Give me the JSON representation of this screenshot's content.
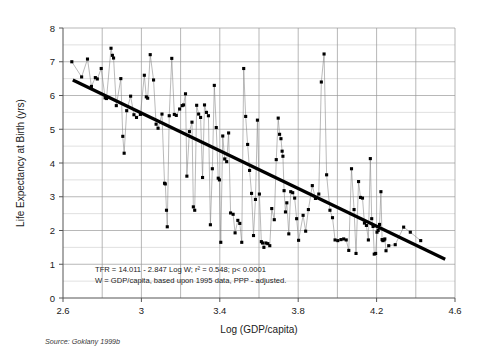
{
  "figure": {
    "background_color": "#ffffff",
    "source_note": "Source: Goklany 1999b"
  },
  "chart_data": {
    "type": "scatter",
    "title": "",
    "subtitle": "",
    "xlabel": "Log (GDP/capita)",
    "ylabel": "Life Expectancy at Birth (yrs)",
    "xlim": [
      2.6,
      4.6
    ],
    "ylim": [
      0,
      8
    ],
    "xticks": [
      2.6,
      3,
      3.4,
      3.8,
      4.2,
      4.6
    ],
    "xtick_labels": [
      "2.6",
      "3",
      "3.4",
      "3.8",
      "4.2",
      "4.6"
    ],
    "yticks": [
      0,
      1,
      2,
      3,
      4,
      5,
      6,
      7,
      8
    ],
    "ytick_labels": [
      "0",
      "1",
      "2",
      "3",
      "4",
      "5",
      "6",
      "7",
      "8"
    ],
    "grid": "both",
    "grid_x_step": 0.2,
    "grid_y_major_step": 1,
    "grid_y_minor_step": 0.5,
    "legend": "none",
    "marker": "square",
    "marker_color": "#000000",
    "connector_color": "#808080",
    "connected": true,
    "annotations": [
      "TFR = 14.011 - 2.847 Log W; r² = 0.548; p< 0.0001",
      "W = GDP/capita, based upon 1995 data, PPP - adjusted."
    ],
    "trendline": {
      "label": "TFR = 14.011 - 2.847 Log W",
      "intercept": 14.011,
      "slope": -2.847,
      "r_squared": 0.548,
      "p_value": "< 0.0001",
      "color": "#000000",
      "width": 3.2,
      "x_start": 2.65,
      "y_start": 6.46,
      "x_end": 4.55,
      "y_end": 1.15
    },
    "points": [
      [
        2.645,
        7.0
      ],
      [
        2.695,
        6.55
      ],
      [
        2.725,
        7.08
      ],
      [
        2.745,
        6.27
      ],
      [
        2.765,
        6.53
      ],
      [
        2.775,
        6.49
      ],
      [
        2.795,
        6.8
      ],
      [
        2.815,
        5.93
      ],
      [
        2.822,
        5.91
      ],
      [
        2.845,
        7.4
      ],
      [
        2.852,
        7.19
      ],
      [
        2.858,
        7.11
      ],
      [
        2.872,
        5.7
      ],
      [
        2.895,
        6.5
      ],
      [
        2.905,
        4.79
      ],
      [
        2.912,
        4.29
      ],
      [
        2.925,
        5.55
      ],
      [
        2.945,
        5.98
      ],
      [
        2.962,
        5.43
      ],
      [
        2.975,
        5.35
      ],
      [
        2.995,
        5.44
      ],
      [
        3.015,
        6.6
      ],
      [
        3.025,
        5.96
      ],
      [
        3.032,
        5.92
      ],
      [
        3.045,
        7.21
      ],
      [
        3.062,
        6.46
      ],
      [
        3.075,
        5.15
      ],
      [
        3.085,
        5.03
      ],
      [
        3.105,
        5.45
      ],
      [
        3.118,
        3.4
      ],
      [
        3.122,
        3.38
      ],
      [
        3.128,
        2.6
      ],
      [
        3.132,
        2.11
      ],
      [
        3.142,
        5.4
      ],
      [
        3.155,
        7.1
      ],
      [
        3.168,
        5.44
      ],
      [
        3.178,
        5.41
      ],
      [
        3.195,
        5.6
      ],
      [
        3.208,
        5.7
      ],
      [
        3.215,
        5.72
      ],
      [
        3.225,
        6.05
      ],
      [
        3.232,
        3.61
      ],
      [
        3.245,
        4.93
      ],
      [
        3.258,
        5.21
      ],
      [
        3.265,
        2.7
      ],
      [
        3.272,
        2.6
      ],
      [
        3.282,
        5.71
      ],
      [
        3.292,
        5.45
      ],
      [
        3.302,
        5.35
      ],
      [
        3.312,
        3.57
      ],
      [
        3.322,
        5.72
      ],
      [
        3.332,
        5.5
      ],
      [
        3.342,
        5.4
      ],
      [
        3.352,
        2.17
      ],
      [
        3.362,
        3.83
      ],
      [
        3.372,
        6.3
      ],
      [
        3.382,
        5.05
      ],
      [
        3.392,
        3.55
      ],
      [
        3.398,
        3.5
      ],
      [
        3.405,
        1.65
      ],
      [
        3.415,
        4.8
      ],
      [
        3.425,
        4.12
      ],
      [
        3.435,
        4.04
      ],
      [
        3.445,
        4.89
      ],
      [
        3.455,
        2.52
      ],
      [
        3.468,
        2.48
      ],
      [
        3.478,
        1.93
      ],
      [
        3.492,
        2.3
      ],
      [
        3.502,
        2.21
      ],
      [
        3.512,
        1.65
      ],
      [
        3.522,
        6.8
      ],
      [
        3.532,
        5.38
      ],
      [
        3.542,
        4.55
      ],
      [
        3.552,
        3.78
      ],
      [
        3.562,
        3.1
      ],
      [
        3.572,
        1.85
      ],
      [
        3.582,
        2.92
      ],
      [
        3.592,
        5.27
      ],
      [
        3.602,
        3.08
      ],
      [
        3.612,
        1.67
      ],
      [
        3.618,
        1.63
      ],
      [
        3.625,
        1.5
      ],
      [
        3.635,
        1.63
      ],
      [
        3.645,
        1.61
      ],
      [
        3.655,
        1.55
      ],
      [
        3.665,
        2.65
      ],
      [
        3.678,
        2.32
      ],
      [
        3.688,
        4.1
      ],
      [
        3.698,
        5.33
      ],
      [
        3.705,
        4.85
      ],
      [
        3.712,
        4.72
      ],
      [
        3.718,
        4.35
      ],
      [
        3.722,
        4.2
      ],
      [
        3.728,
        3.18
      ],
      [
        3.735,
        2.55
      ],
      [
        3.742,
        2.82
      ],
      [
        3.752,
        1.9
      ],
      [
        3.762,
        3.15
      ],
      [
        3.772,
        3.12
      ],
      [
        3.782,
        2.96
      ],
      [
        3.792,
        2.35
      ],
      [
        3.802,
        1.71
      ],
      [
        3.825,
        2.45
      ],
      [
        3.838,
        1.98
      ],
      [
        3.852,
        2.62
      ],
      [
        3.872,
        3.33
      ],
      [
        3.888,
        2.95
      ],
      [
        3.905,
        3.08
      ],
      [
        3.918,
        6.4
      ],
      [
        3.932,
        7.23
      ],
      [
        3.945,
        3.65
      ],
      [
        3.962,
        2.6
      ],
      [
        3.975,
        2.38
      ],
      [
        3.988,
        1.72
      ],
      [
        4.002,
        1.7
      ],
      [
        4.018,
        1.73
      ],
      [
        4.032,
        1.75
      ],
      [
        4.045,
        1.72
      ],
      [
        4.058,
        1.41
      ],
      [
        4.072,
        3.83
      ],
      [
        4.085,
        2.62
      ],
      [
        4.095,
        1.32
      ],
      [
        4.108,
        3.45
      ],
      [
        4.118,
        2.98
      ],
      [
        4.128,
        2.96
      ],
      [
        4.138,
        2.22
      ],
      [
        4.148,
        2.15
      ],
      [
        4.158,
        1.72
      ],
      [
        4.168,
        4.13
      ],
      [
        4.175,
        2.35
      ],
      [
        4.182,
        2.12
      ],
      [
        4.188,
        1.3
      ],
      [
        4.195,
        1.32
      ],
      [
        4.202,
        1.95
      ],
      [
        4.208,
        2.0
      ],
      [
        4.215,
        2.18
      ],
      [
        4.222,
        3.15
      ],
      [
        4.228,
        1.73
      ],
      [
        4.232,
        1.7
      ],
      [
        4.238,
        1.72
      ],
      [
        4.242,
        1.75
      ],
      [
        4.248,
        1.4
      ],
      [
        4.262,
        1.55
      ],
      [
        4.295,
        1.58
      ],
      [
        4.338,
        2.1
      ],
      [
        4.372,
        1.95
      ],
      [
        4.425,
        1.7
      ]
    ],
    "num_points": 147
  }
}
